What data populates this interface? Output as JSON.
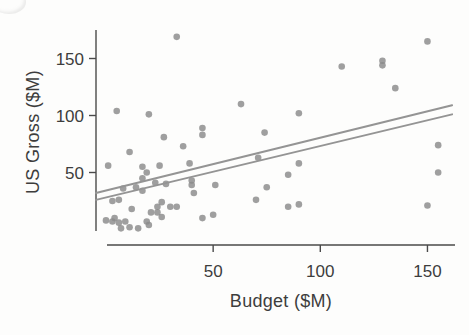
{
  "figure": {
    "background": "#fdfdfc",
    "dot_color": "#8a8a8a",
    "dot_opacity": 0.82,
    "dot_radius": 3.3,
    "trend_line_color": "#949494",
    "trend_line_width": 2,
    "axis_color": "#4a4a4a",
    "text_color": "#3d3d3d",
    "tick_font_size": 17
  },
  "chart_data": {
    "type": "scatter",
    "title": "",
    "xlabel": "Budget ($M)",
    "ylabel": "US Gross ($M)",
    "xlim": [
      -5,
      165
    ],
    "ylim": [
      -14,
      180
    ],
    "x_ticks": [
      50,
      100,
      150
    ],
    "y_ticks": [
      50,
      100,
      150
    ],
    "grid": false,
    "legend": null,
    "points": [
      [
        33,
        169
      ],
      [
        150,
        165
      ],
      [
        110,
        143
      ],
      [
        129,
        148
      ],
      [
        129,
        144
      ],
      [
        135,
        124
      ],
      [
        5,
        104
      ],
      [
        20,
        101
      ],
      [
        63,
        110
      ],
      [
        90,
        102
      ],
      [
        45,
        89
      ],
      [
        45,
        83
      ],
      [
        27,
        81
      ],
      [
        74,
        85
      ],
      [
        71,
        63
      ],
      [
        90,
        58
      ],
      [
        85,
        48
      ],
      [
        75,
        37
      ],
      [
        70,
        26
      ],
      [
        85,
        20
      ],
      [
        90,
        22
      ],
      [
        155,
        74
      ],
      [
        155,
        50
      ],
      [
        150,
        21
      ],
      [
        36,
        73
      ],
      [
        39,
        58
      ],
      [
        40,
        43
      ],
      [
        40,
        39
      ],
      [
        41,
        32
      ],
      [
        51,
        39
      ],
      [
        45,
        10
      ],
      [
        50,
        13
      ],
      [
        30,
        20
      ],
      [
        33,
        20
      ],
      [
        11,
        68
      ],
      [
        1,
        56
      ],
      [
        17,
        55
      ],
      [
        25,
        56
      ],
      [
        19,
        50
      ],
      [
        17,
        45
      ],
      [
        8,
        36
      ],
      [
        14,
        37
      ],
      [
        23,
        41
      ],
      [
        28,
        40
      ],
      [
        17,
        34
      ],
      [
        3,
        25
      ],
      [
        6,
        26
      ],
      [
        12,
        18
      ],
      [
        21,
        15
      ],
      [
        24,
        20
      ],
      [
        26,
        24
      ],
      [
        26,
        11
      ],
      [
        24,
        15
      ],
      [
        0,
        8
      ],
      [
        3,
        7
      ],
      [
        6,
        6
      ],
      [
        9,
        7
      ],
      [
        7,
        1
      ],
      [
        11,
        2
      ],
      [
        15,
        1
      ],
      [
        19,
        7
      ],
      [
        20,
        4
      ],
      [
        4,
        10
      ]
    ],
    "trend_lines": [
      {
        "name": "regression-line-upper",
        "x1": -4.7,
        "y1": 32,
        "x2": 161.5,
        "y2": 109
      },
      {
        "name": "regression-line-lower",
        "x1": -4.7,
        "y1": 26,
        "x2": 161.5,
        "y2": 101
      }
    ]
  }
}
